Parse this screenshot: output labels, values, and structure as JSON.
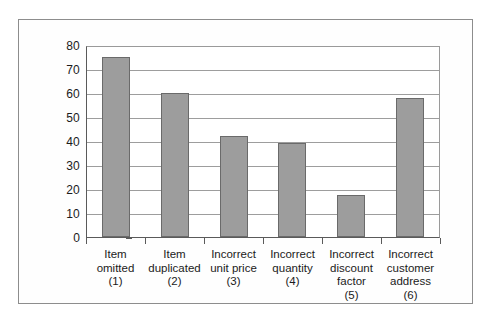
{
  "figure": {
    "frame_border_color": "#8d8d8d",
    "background_color": "#ffffff"
  },
  "chart_data": {
    "type": "bar",
    "title": "",
    "subtitle": "",
    "xlabel": "",
    "ylabel": "",
    "categories": [
      "Item omitted (1)",
      "Item duplicated (2)",
      "Incorrect unit price (3)",
      "Incorrect quantity (4)",
      "Incorrect discount factor (5)",
      "Incorrect customer address (6)"
    ],
    "category_lines": [
      [
        "Item",
        "omitted",
        "(1)"
      ],
      [
        "Item",
        "duplicated",
        "(2)"
      ],
      [
        "Incorrect",
        "unit price",
        "(3)"
      ],
      [
        "Incorrect",
        "quantity",
        "(4)"
      ],
      [
        "Incorrect",
        "discount",
        "factor",
        "(5)"
      ],
      [
        "Incorrect",
        "customer",
        "address",
        "(6)"
      ]
    ],
    "values": [
      75,
      60,
      42,
      39,
      17.5,
      58
    ],
    "ylim": [
      0,
      80
    ],
    "ytick_values": [
      0,
      10,
      20,
      30,
      40,
      50,
      60,
      70,
      80
    ],
    "ytick_labels": [
      "0",
      "10",
      "20",
      "30",
      "40",
      "50",
      "60",
      "70",
      "80"
    ],
    "grid": "horizontal",
    "legend": "none",
    "bar_color": "#9d9d9d",
    "bar_edge_color": "#6a6a6a",
    "axis_color": "#5a5a5a",
    "gridline_color": "#9d9d9d"
  }
}
